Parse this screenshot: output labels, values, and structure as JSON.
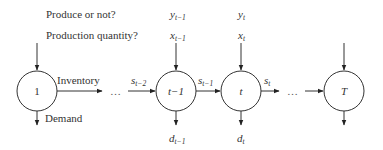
{
  "labels": {
    "produce_question": "Produce or not?",
    "quantity_question": "Production quantity?",
    "inventory": "Inventory",
    "demand": "Demand",
    "ellipsis": "…"
  },
  "nodes": [
    {
      "id": "1",
      "label": "1",
      "italic": false
    },
    {
      "id": "t-1",
      "label": "t−1",
      "italic": true
    },
    {
      "id": "t",
      "label": "t",
      "italic": true
    },
    {
      "id": "T",
      "label": "T",
      "italic": true
    }
  ],
  "variables": {
    "y_prev": {
      "base": "y",
      "sub": "t−1"
    },
    "x_prev": {
      "base": "x",
      "sub": "t−1"
    },
    "y_t": {
      "base": "y",
      "sub": "t"
    },
    "x_t": {
      "base": "x",
      "sub": "t"
    },
    "s_tm2": {
      "base": "s",
      "sub": "t−2"
    },
    "s_tm1": {
      "base": "s",
      "sub": "t−1"
    },
    "s_t": {
      "base": "s",
      "sub": "t"
    },
    "d_prev": {
      "base": "d",
      "sub": "t−1"
    },
    "d_t": {
      "base": "d",
      "sub": "t"
    }
  },
  "colors": {
    "stroke": "#333333",
    "text": "#333333",
    "background": "#ffffff"
  }
}
